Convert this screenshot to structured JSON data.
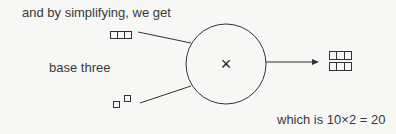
{
  "labels": {
    "top": "and by simplifying, we get",
    "left": "base three",
    "bottom": "which is 10×2 = 20"
  },
  "operator": {
    "symbol": "×",
    "name": "multiply"
  },
  "inputs": [
    {
      "name": "three-box-number",
      "boxes": 3
    },
    {
      "name": "two-small-boxes",
      "boxes": 2
    }
  ],
  "output": {
    "rows": 2,
    "boxes_per_row": 3
  }
}
